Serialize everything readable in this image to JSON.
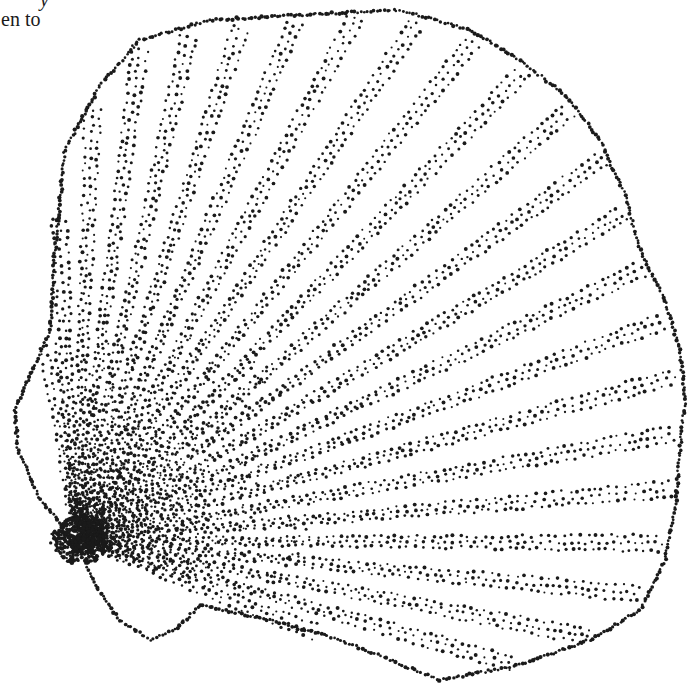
{
  "page": {
    "text_fragments": [
      {
        "line": 1,
        "text": "y",
        "style": "italic"
      },
      {
        "line": 2,
        "text": "en to"
      }
    ]
  },
  "illustration": {
    "subject": "scallop shell",
    "technique": "stipple",
    "ink_color": "#1a1a1a",
    "paper_color": "#ffffff",
    "hinge": [
      75,
      540
    ],
    "rib_count": 24,
    "outline": [
      [
        75,
        540
      ],
      [
        40,
        500
      ],
      [
        18,
        450
      ],
      [
        15,
        410
      ],
      [
        35,
        365
      ],
      [
        50,
        330
      ],
      [
        55,
        250
      ],
      [
        65,
        150
      ],
      [
        100,
        85
      ],
      [
        140,
        40
      ],
      [
        210,
        20
      ],
      [
        300,
        15
      ],
      [
        400,
        10
      ],
      [
        470,
        30
      ],
      [
        520,
        60
      ],
      [
        565,
        95
      ],
      [
        600,
        140
      ],
      [
        625,
        195
      ],
      [
        640,
        250
      ],
      [
        665,
        300
      ],
      [
        680,
        350
      ],
      [
        685,
        400
      ],
      [
        680,
        450
      ],
      [
        675,
        510
      ],
      [
        665,
        560
      ],
      [
        640,
        610
      ],
      [
        590,
        640
      ],
      [
        520,
        665
      ],
      [
        440,
        680
      ],
      [
        390,
        660
      ],
      [
        340,
        640
      ],
      [
        270,
        620
      ],
      [
        200,
        605
      ],
      [
        175,
        630
      ],
      [
        150,
        640
      ],
      [
        120,
        620
      ],
      [
        95,
        585
      ],
      [
        75,
        540
      ]
    ]
  }
}
